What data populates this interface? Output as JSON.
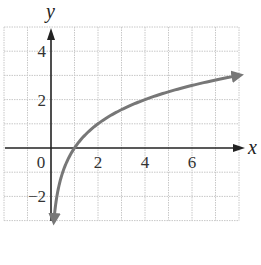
{
  "chart_data": {
    "type": "line",
    "title": "",
    "function": "y = log2(x)",
    "xlabel": "x",
    "ylabel": "y",
    "xlim": [
      -2,
      8
    ],
    "ylim": [
      -3,
      5
    ],
    "grid": true,
    "grid_style": "dotted",
    "x_ticks": [
      {
        "value": 0,
        "label": "0"
      },
      {
        "value": 2,
        "label": "2"
      },
      {
        "value": 4,
        "label": "4"
      },
      {
        "value": 6,
        "label": "6"
      }
    ],
    "y_ticks": [
      {
        "value": 4,
        "label": "4"
      },
      {
        "value": 2,
        "label": "2"
      },
      {
        "value": -2,
        "label": "−2"
      }
    ],
    "series": [
      {
        "name": "curve",
        "color": "#777777",
        "x": [
          0.125,
          0.25,
          0.5,
          1,
          2,
          4,
          8
        ],
        "y": [
          -3,
          -2,
          -1,
          0,
          1,
          2,
          3
        ],
        "arrow_both_ends": true
      }
    ],
    "axis_color": "#222222",
    "grid_color": "#c8c8c8"
  }
}
